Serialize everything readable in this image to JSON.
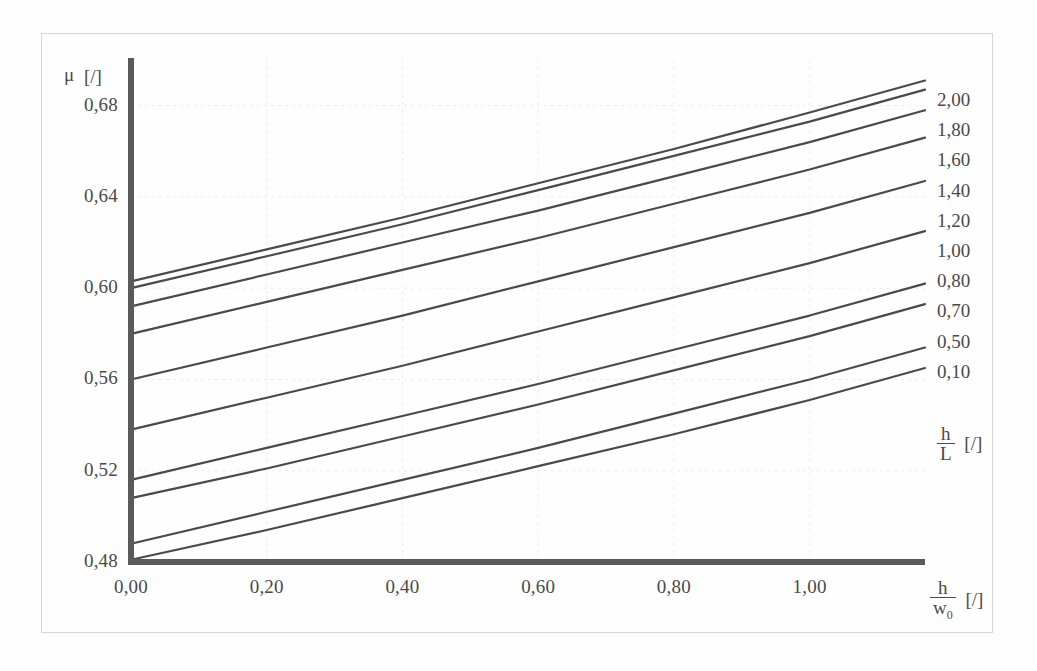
{
  "figure": {
    "background_color": "#fdfdfd",
    "frame_color": "#d6d6d6",
    "curve_color": "#4a4a4a",
    "grid_color": "#ececec"
  },
  "axes": {
    "y": {
      "label_symbol": "μ",
      "label_unit": "[/]",
      "ticks": [
        "0,48",
        "0,52",
        "0,56",
        "0,60",
        "0,64",
        "0,68"
      ],
      "tick_values": [
        0.48,
        0.52,
        0.56,
        0.6,
        0.64,
        0.68
      ],
      "min": 0.48,
      "max": 0.7
    },
    "x": {
      "label_numerator": "h",
      "label_denominator": "w",
      "label_denominator_sub": "0",
      "label_unit": "[/]",
      "ticks": [
        "0,00",
        "0,20",
        "0,40",
        "0,60",
        "0,80",
        "1,00"
      ],
      "tick_values": [
        0.0,
        0.2,
        0.4,
        0.6,
        0.8,
        1.0
      ],
      "min": 0.0,
      "max": 1.17
    }
  },
  "legend": {
    "label_numerator": "h",
    "label_denominator": "L",
    "label_unit": "[/]",
    "entries": [
      "2,00",
      "1,80",
      "1,60",
      "1,40",
      "1,20",
      "1,00",
      "0,80",
      "0,70",
      "0,50",
      "0,10"
    ]
  },
  "chart_data": {
    "type": "line",
    "title": "",
    "subtitle": "",
    "xlabel": "h/w0 [/]",
    "ylabel": "μ [/]",
    "xlim": [
      0.0,
      1.17
    ],
    "ylim": [
      0.48,
      0.7
    ],
    "grid": true,
    "legend_position": "right-outside",
    "legend_title": "h/L [/]",
    "x": [
      0.0,
      0.2,
      0.4,
      0.6,
      0.8,
      1.0,
      1.17
    ],
    "series": [
      {
        "name": "2,00",
        "values": [
          0.603,
          0.617,
          0.631,
          0.646,
          0.661,
          0.677,
          0.691
        ]
      },
      {
        "name": "1,80",
        "values": [
          0.6,
          0.614,
          0.628,
          0.643,
          0.658,
          0.673,
          0.687
        ]
      },
      {
        "name": "1,60",
        "values": [
          0.592,
          0.606,
          0.62,
          0.634,
          0.649,
          0.664,
          0.678
        ]
      },
      {
        "name": "1,40",
        "values": [
          0.58,
          0.594,
          0.608,
          0.622,
          0.637,
          0.652,
          0.666
        ]
      },
      {
        "name": "1,20",
        "values": [
          0.56,
          0.574,
          0.588,
          0.603,
          0.618,
          0.633,
          0.647
        ]
      },
      {
        "name": "1,00",
        "values": [
          0.538,
          0.552,
          0.566,
          0.581,
          0.596,
          0.611,
          0.625
        ]
      },
      {
        "name": "0,80",
        "values": [
          0.516,
          0.53,
          0.544,
          0.558,
          0.573,
          0.588,
          0.602
        ]
      },
      {
        "name": "0,70",
        "values": [
          0.508,
          0.521,
          0.535,
          0.549,
          0.564,
          0.579,
          0.593
        ]
      },
      {
        "name": "0,50",
        "values": [
          0.488,
          0.502,
          0.516,
          0.53,
          0.545,
          0.56,
          0.574
        ]
      },
      {
        "name": "0,10",
        "values": [
          0.481,
          0.494,
          0.508,
          0.522,
          0.536,
          0.551,
          0.565
        ]
      }
    ]
  }
}
